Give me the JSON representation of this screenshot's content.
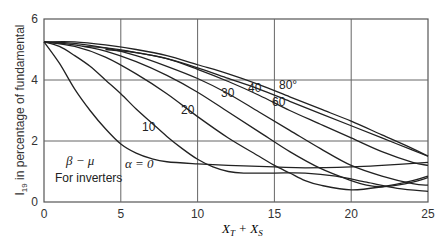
{
  "chart_data": {
    "type": "line",
    "title": "",
    "xlabel": "X_T + X_S",
    "ylabel": "I_19 in percentage of fundamental",
    "xlim": [
      0,
      25
    ],
    "ylim": [
      0,
      6
    ],
    "xticks": [
      0,
      5,
      10,
      15,
      20,
      25
    ],
    "yticks": [
      0,
      2,
      4,
      6
    ],
    "grid": true,
    "legend": "none (inline curve labels)",
    "annotations": [
      "β − μ",
      "For inverters"
    ],
    "series": [
      {
        "name": "α = 0",
        "label": "α = 0",
        "x": [
          0,
          1,
          2,
          3,
          4,
          5,
          6,
          7,
          8,
          10,
          12,
          15,
          17,
          20,
          22,
          25
        ],
        "y": [
          5.25,
          4.55,
          3.7,
          3.0,
          2.4,
          1.9,
          1.6,
          1.42,
          1.32,
          1.25,
          1.2,
          1.15,
          1.12,
          1.15,
          1.2,
          1.3
        ]
      },
      {
        "name": "α = 10",
        "label": "10",
        "x": [
          0,
          1,
          2,
          3,
          4,
          5,
          6,
          7,
          8,
          9,
          10,
          11,
          12,
          13,
          15,
          17,
          19,
          21,
          23,
          25
        ],
        "y": [
          5.25,
          5.1,
          4.8,
          4.45,
          4.0,
          3.55,
          3.05,
          2.6,
          2.15,
          1.75,
          1.4,
          1.15,
          1.0,
          0.95,
          0.95,
          0.95,
          0.85,
          0.65,
          0.45,
          0.35
        ]
      },
      {
        "name": "α = 20",
        "label": "20",
        "x": [
          0,
          2,
          4,
          6,
          8,
          10,
          12,
          14,
          15,
          16,
          17,
          18,
          20,
          22,
          24,
          25
        ],
        "y": [
          5.25,
          5.1,
          4.75,
          4.2,
          3.55,
          2.8,
          2.1,
          1.5,
          1.2,
          0.95,
          0.7,
          0.55,
          0.4,
          0.5,
          0.7,
          0.85
        ]
      },
      {
        "name": "α = 30",
        "label": "30",
        "x": [
          0,
          2,
          4,
          6,
          8,
          10,
          12,
          14,
          16,
          18,
          20,
          21,
          22,
          23,
          24,
          25
        ],
        "y": [
          5.25,
          5.15,
          4.95,
          4.6,
          4.15,
          3.6,
          2.95,
          2.3,
          1.65,
          1.1,
          0.7,
          0.55,
          0.5,
          0.55,
          0.65,
          0.8
        ]
      },
      {
        "name": "α = 40",
        "label": "40",
        "x": [
          0,
          2,
          4,
          6,
          8,
          10,
          12,
          14,
          16,
          18,
          20,
          22,
          24,
          25
        ],
        "y": [
          5.25,
          5.2,
          5.05,
          4.8,
          4.45,
          4.05,
          3.55,
          2.95,
          2.35,
          1.75,
          1.2,
          0.85,
          0.6,
          0.55
        ]
      },
      {
        "name": "α = 60",
        "label": "60",
        "x": [
          2.5,
          4,
          6,
          8,
          10,
          12,
          14,
          16,
          18,
          20,
          22,
          24,
          25
        ],
        "y": [
          5.1,
          5.05,
          4.9,
          4.7,
          4.35,
          3.95,
          3.5,
          3.0,
          2.55,
          2.1,
          1.65,
          1.3,
          1.2
        ]
      },
      {
        "name": "α = 80°",
        "label": "80°",
        "x": [
          4,
          6,
          8,
          10,
          12,
          14,
          16,
          18,
          20,
          22,
          24,
          25
        ],
        "y": [
          5.0,
          4.9,
          4.7,
          4.4,
          4.05,
          3.7,
          3.3,
          2.9,
          2.5,
          2.1,
          1.7,
          1.5
        ]
      },
      {
        "name": "α = 80° (upper)",
        "label": "",
        "x": [
          0,
          2,
          4,
          6,
          8,
          10,
          12,
          14,
          16,
          18,
          20,
          22,
          24,
          25
        ],
        "y": [
          5.25,
          5.25,
          5.15,
          5.0,
          4.8,
          4.5,
          4.2,
          3.85,
          3.45,
          3.05,
          2.65,
          2.2,
          1.75,
          1.5
        ]
      }
    ]
  }
}
